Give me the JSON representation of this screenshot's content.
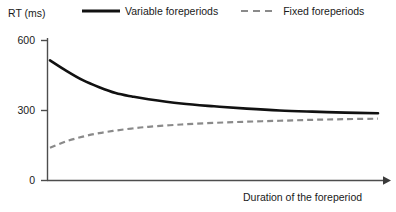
{
  "chart_data": {
    "type": "line",
    "title": "",
    "xlabel": "Duration of the foreperiod",
    "ylabel": "RT (ms)",
    "ylim": [
      0,
      600
    ],
    "yticks": [
      0,
      300,
      600
    ],
    "ytick_labels": [
      "0",
      "300",
      "600"
    ],
    "xticks": [],
    "xtick_labels": [],
    "grid": false,
    "legend_position": "top",
    "axis_arrow_x": true,
    "series": [
      {
        "name": "Variable foreperiods",
        "style": "solid",
        "color": "#111111",
        "x": [
          0,
          5,
          10,
          15,
          20,
          25,
          30,
          40,
          50,
          60,
          70,
          80,
          90,
          100
        ],
        "values": [
          515,
          470,
          430,
          400,
          375,
          360,
          348,
          330,
          318,
          308,
          300,
          295,
          291,
          288
        ]
      },
      {
        "name": "Fixed foreperiods",
        "style": "dashed",
        "color": "#8a8a8a",
        "x": [
          0,
          5,
          10,
          15,
          20,
          25,
          30,
          40,
          50,
          60,
          70,
          80,
          90,
          100
        ],
        "values": [
          140,
          168,
          188,
          203,
          214,
          223,
          230,
          240,
          247,
          252,
          256,
          260,
          263,
          265
        ]
      }
    ]
  },
  "legend": {
    "entries": [
      {
        "label": "Variable foreperiods",
        "style": "solid",
        "color": "#111111"
      },
      {
        "label": "Fixed foreperiods",
        "style": "dashed",
        "color": "#8a8a8a"
      }
    ]
  },
  "axes": {
    "y_title": "RT (ms)",
    "x_title": "Duration of the foreperiod",
    "y_tick_600": "600",
    "y_tick_300": "300",
    "y_tick_0": "0"
  },
  "colors": {
    "axis": "#4d4d4d",
    "solid_series": "#111111",
    "dashed_series": "#8a8a8a",
    "text": "#1a1a1a",
    "background": "#ffffff"
  }
}
